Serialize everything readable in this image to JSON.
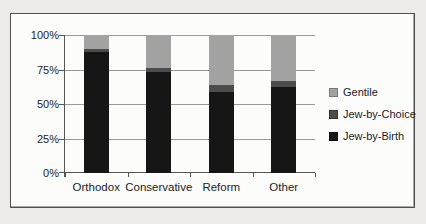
{
  "chart_data": {
    "type": "bar",
    "subtype": "stacked-100-percent",
    "title": "",
    "xlabel": "",
    "ylabel": "",
    "categories": [
      "Orthodox",
      "Conservative",
      "Reform",
      "Other"
    ],
    "series": [
      {
        "name": "Jew-by-Birth",
        "color": "#161616",
        "values": [
          88,
          73,
          59,
          62
        ]
      },
      {
        "name": "Jew-by-Choice",
        "color": "#4c4c4c",
        "values": [
          2,
          3,
          5,
          5
        ]
      },
      {
        "name": "Gentile",
        "color": "#a2a2a2",
        "values": [
          10,
          24,
          36,
          33
        ]
      }
    ],
    "y_tick_labels": [
      "100%",
      "75%",
      "50%",
      "25%",
      "0%"
    ],
    "ylim": [
      0,
      100
    ],
    "grid": true,
    "legend": {
      "position": "right",
      "entries": [
        {
          "label": "Gentile",
          "color": "#a2a2a2"
        },
        {
          "label": "Jew-by-Choice",
          "color": "#4c4c4c"
        },
        {
          "label": "Jew-by-Birth",
          "color": "#161616"
        }
      ]
    }
  }
}
